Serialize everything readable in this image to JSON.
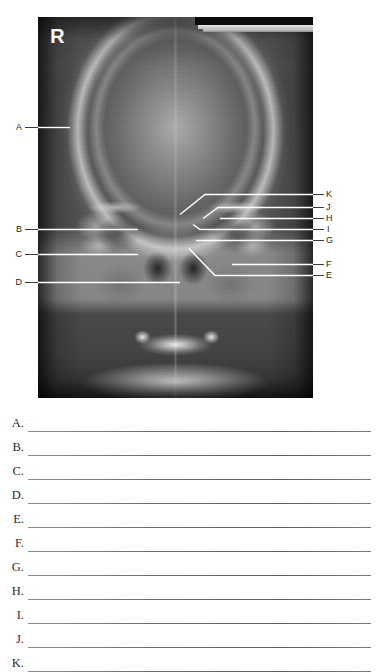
{
  "figure": {
    "name": "skull-radiograph-pa-view",
    "orientation_marker": "Я",
    "orientation_marker_meaning": "right-side-marker",
    "labels_left": [
      {
        "id": "A",
        "text": "A"
      },
      {
        "id": "B",
        "text": "B"
      },
      {
        "id": "C",
        "text": "C"
      },
      {
        "id": "D",
        "text": "D"
      }
    ],
    "labels_right": [
      {
        "id": "K",
        "text": "K"
      },
      {
        "id": "J",
        "text": "J"
      },
      {
        "id": "H",
        "text": "H"
      },
      {
        "id": "I",
        "text": "I"
      },
      {
        "id": "G",
        "text": "G"
      },
      {
        "id": "F",
        "text": "F"
      },
      {
        "id": "E",
        "text": "E"
      }
    ]
  },
  "answers": {
    "rows": [
      {
        "letter": "A.",
        "value": ""
      },
      {
        "letter": "B.",
        "value": ""
      },
      {
        "letter": "C.",
        "value": ""
      },
      {
        "letter": "D.",
        "value": ""
      },
      {
        "letter": "E.",
        "value": ""
      },
      {
        "letter": "F.",
        "value": ""
      },
      {
        "letter": "G.",
        "value": ""
      },
      {
        "letter": "H.",
        "value": ""
      },
      {
        "letter": "I.",
        "value": ""
      },
      {
        "letter": "J.",
        "value": ""
      },
      {
        "letter": "K.",
        "value": ""
      }
    ]
  },
  "colors": {
    "page_background": "#ffffff",
    "text": "#231f20",
    "rule": "#6f6f6f",
    "leader_line": "#ffffff",
    "film_dark": "#2f2f2f",
    "film_light": "#ececec"
  }
}
